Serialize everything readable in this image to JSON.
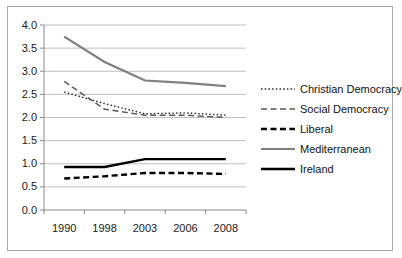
{
  "figure": {
    "background": "#ffffff",
    "border_color": "#a8a8a8"
  },
  "chart_data": {
    "type": "line",
    "title": "",
    "xlabel": "",
    "ylabel": "",
    "categories": [
      "1990",
      "1998",
      "2003",
      "2006",
      "2008"
    ],
    "series": [
      {
        "name": "Christian Democracy",
        "values": [
          2.55,
          2.3,
          2.08,
          2.1,
          2.05
        ],
        "color": "#262626",
        "style": "dotted",
        "width": 1.4
      },
      {
        "name": "Social Democracy",
        "values": [
          2.78,
          2.18,
          2.05,
          2.05,
          2.0
        ],
        "color": "#595959",
        "style": "dashed",
        "width": 1.5
      },
      {
        "name": "Liberal",
        "values": [
          0.68,
          0.73,
          0.8,
          0.8,
          0.78
        ],
        "color": "#000000",
        "style": "dashed",
        "width": 2.4
      },
      {
        "name": "Mediterranean",
        "values": [
          3.75,
          3.2,
          2.8,
          2.75,
          2.68
        ],
        "color": "#7f7f7f",
        "style": "solid",
        "width": 2.2
      },
      {
        "name": "Ireland",
        "values": [
          0.93,
          0.93,
          1.1,
          1.1,
          1.1
        ],
        "color": "#000000",
        "style": "solid",
        "width": 2.4
      }
    ],
    "ylim": [
      0,
      4
    ],
    "yticks": [
      "0.0",
      "0.5",
      "1.0",
      "1.5",
      "2.0",
      "2.5",
      "3.0",
      "3.5",
      "4.0"
    ],
    "grid": true,
    "gridline_color": "#bfbfbf",
    "axis_color": "#898989",
    "tick_label_color": "#1a1a1a",
    "legend_position": "right"
  }
}
